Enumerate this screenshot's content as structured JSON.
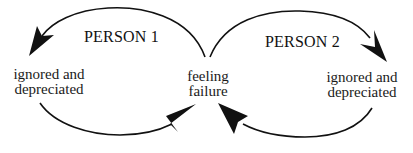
{
  "diagram": {
    "type": "cycle-diagram",
    "colors": {
      "background": "#ffffff",
      "stroke": "#111111",
      "text": "#1a1a1a"
    },
    "loops": [
      {
        "title": "PERSON 1",
        "node": {
          "line1": "ignored and",
          "line2": "depreciated"
        }
      },
      {
        "title": "PERSON 2",
        "node": {
          "line1": "ignored and",
          "line2": "depreciated"
        }
      }
    ],
    "center": {
      "line1": "feeling",
      "line2": "failure"
    },
    "edges": [
      {
        "from": "feeling failure",
        "to": "Person 1: ignored and depreciated",
        "direction": "upper-arc-leftward"
      },
      {
        "from": "Person 1: ignored and depreciated",
        "to": "feeling failure",
        "direction": "lower-arc-rightward"
      },
      {
        "from": "feeling failure",
        "to": "Person 2: ignored and depreciated",
        "direction": "upper-arc-rightward"
      },
      {
        "from": "Person 2: ignored and depreciated",
        "to": "feeling failure",
        "direction": "lower-arc-leftward"
      }
    ]
  }
}
